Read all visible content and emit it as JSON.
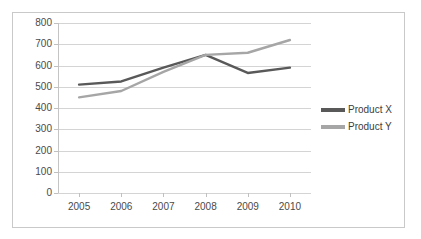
{
  "chart_data": {
    "type": "line",
    "title": "",
    "xlabel": "",
    "ylabel": "",
    "categories": [
      "2005",
      "2006",
      "2007",
      "2008",
      "2009",
      "2010"
    ],
    "yticks": [
      0,
      100,
      200,
      300,
      400,
      500,
      600,
      700,
      800
    ],
    "ylim": [
      0,
      800
    ],
    "grid": true,
    "legend_position": "right",
    "series": [
      {
        "name": "Product X",
        "color": "#595959",
        "values": [
          510,
          525,
          590,
          650,
          565,
          590
        ]
      },
      {
        "name": "Product Y",
        "color": "#a6a6a6",
        "values": [
          450,
          480,
          570,
          650,
          660,
          720
        ]
      }
    ]
  },
  "legend": {
    "items": [
      {
        "label": "Product X",
        "color": "#595959"
      },
      {
        "label": "Product Y",
        "color": "#a6a6a6"
      }
    ]
  },
  "colors": {
    "gridline": "#d4d4d4",
    "axis": "#c4c4c4",
    "border": "#c9c9c9",
    "tick_text": "#4a4a4a",
    "background": "#ffffff"
  }
}
